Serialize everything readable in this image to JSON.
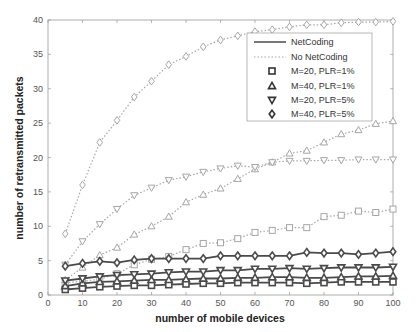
{
  "chart_data": {
    "type": "line",
    "title": "",
    "xlabel": "number of mobile devices",
    "ylabel": "number of retransmitted packets",
    "xlim": [
      0,
      100
    ],
    "ylim": [
      0,
      40
    ],
    "xticks": [
      0,
      10,
      20,
      30,
      40,
      50,
      60,
      70,
      80,
      90,
      100
    ],
    "yticks": [
      0,
      5,
      10,
      15,
      20,
      25,
      30,
      35,
      40
    ],
    "grid": false,
    "legend_position": "upper right (inside)",
    "legend": [
      {
        "label": "NetCoding",
        "style": "solid"
      },
      {
        "label": "No NetCoding",
        "style": "dotted"
      },
      {
        "label": "M=20, PLR=1%",
        "marker": "square"
      },
      {
        "label": "M=40, PLR=1%",
        "marker": "triangle-up"
      },
      {
        "label": "M=20, PLR=5%",
        "marker": "triangle-down"
      },
      {
        "label": "M=40, PLR=5%",
        "marker": "diamond"
      }
    ],
    "x": [
      5,
      10,
      15,
      20,
      25,
      30,
      35,
      40,
      45,
      50,
      55,
      60,
      65,
      70,
      75,
      80,
      85,
      90,
      95,
      100
    ],
    "series": [
      {
        "name": "NetCoding, M=20, PLR=1%",
        "style": "solid",
        "marker": "square",
        "values": [
          0.8,
          1.0,
          1.2,
          1.3,
          1.4,
          1.4,
          1.5,
          1.6,
          1.7,
          1.7,
          1.8,
          1.8,
          1.8,
          1.8,
          1.7,
          1.8,
          1.9,
          1.9,
          1.9,
          1.9
        ]
      },
      {
        "name": "NetCoding, M=40, PLR=1%",
        "style": "solid",
        "marker": "triangle-up",
        "values": [
          1.3,
          1.7,
          1.9,
          2.0,
          2.1,
          2.2,
          2.2,
          2.3,
          2.4,
          2.4,
          2.5,
          2.5,
          2.6,
          2.6,
          2.5,
          2.5,
          2.6,
          2.7,
          2.7,
          2.8
        ]
      },
      {
        "name": "NetCoding, M=20, PLR=5%",
        "style": "solid",
        "marker": "triangle-down",
        "values": [
          2.1,
          2.4,
          2.7,
          2.9,
          3.0,
          3.1,
          3.3,
          3.4,
          3.4,
          3.6,
          3.6,
          3.8,
          3.8,
          3.9,
          3.8,
          3.9,
          4.0,
          4.0,
          4.0,
          4.1
        ]
      },
      {
        "name": "NetCoding, M=40, PLR=5%",
        "style": "solid",
        "marker": "diamond",
        "values": [
          4.2,
          4.6,
          4.9,
          4.7,
          5.1,
          5.3,
          5.3,
          5.3,
          5.3,
          5.7,
          5.7,
          5.7,
          5.7,
          5.7,
          6.2,
          6.1,
          6.1,
          5.9,
          6.1,
          6.3
        ]
      },
      {
        "name": "No NetCoding, M=20, PLR=1%",
        "style": "dotted",
        "marker": "square",
        "values": [
          1.8,
          2.0,
          2.3,
          3.1,
          4.4,
          5.2,
          5.6,
          6.6,
          7.5,
          7.6,
          8.2,
          9.1,
          9.4,
          9.8,
          9.8,
          11.4,
          11.6,
          12.2,
          12.0,
          12.5
        ]
      },
      {
        "name": "No NetCoding, M=40, PLR=1%",
        "style": "dotted",
        "marker": "triangle-up",
        "values": [
          2.2,
          4.0,
          5.8,
          6.9,
          8.8,
          10.0,
          11.4,
          13.5,
          14.6,
          15.5,
          16.9,
          18.3,
          19.3,
          20.6,
          21.0,
          22.2,
          23.4,
          24.0,
          24.9,
          25.3
        ]
      },
      {
        "name": "No NetCoding, M=20, PLR=5%",
        "style": "dotted",
        "marker": "triangle-down",
        "values": [
          4.4,
          7.8,
          10.3,
          12.5,
          14.5,
          15.6,
          16.7,
          17.2,
          17.9,
          18.4,
          18.8,
          18.6,
          19.3,
          19.5,
          19.5,
          19.6,
          19.6,
          19.7,
          19.7,
          19.7
        ]
      },
      {
        "name": "No NetCoding, M=40, PLR=5%",
        "style": "dotted",
        "marker": "diamond",
        "values": [
          8.9,
          16.0,
          22.2,
          25.4,
          28.8,
          31.1,
          33.5,
          34.7,
          36.1,
          37.1,
          37.7,
          38.3,
          38.6,
          39.0,
          39.3,
          39.3,
          39.6,
          39.7,
          39.7,
          39.8
        ]
      }
    ]
  },
  "colors": {
    "netcoding_line": "#4a4a4a",
    "no_netcoding_line": "#a6a6a6",
    "axis": "#999999",
    "background": "#ffffff"
  }
}
